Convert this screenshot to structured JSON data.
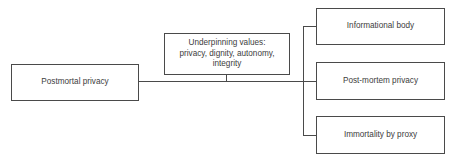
{
  "diagram": {
    "root": {
      "label": "Postmortal privacy"
    },
    "values_node": {
      "label": "Underpinning values:\nprivacy, dignity, autonomy,\nintegrity"
    },
    "branches": [
      {
        "label": "Informational body"
      },
      {
        "label": "Post-mortem privacy"
      },
      {
        "label": "Immortality by proxy"
      }
    ],
    "colors": {
      "border": "#4a4a4a",
      "text": "#3d3d3d",
      "background": "#ffffff"
    }
  }
}
